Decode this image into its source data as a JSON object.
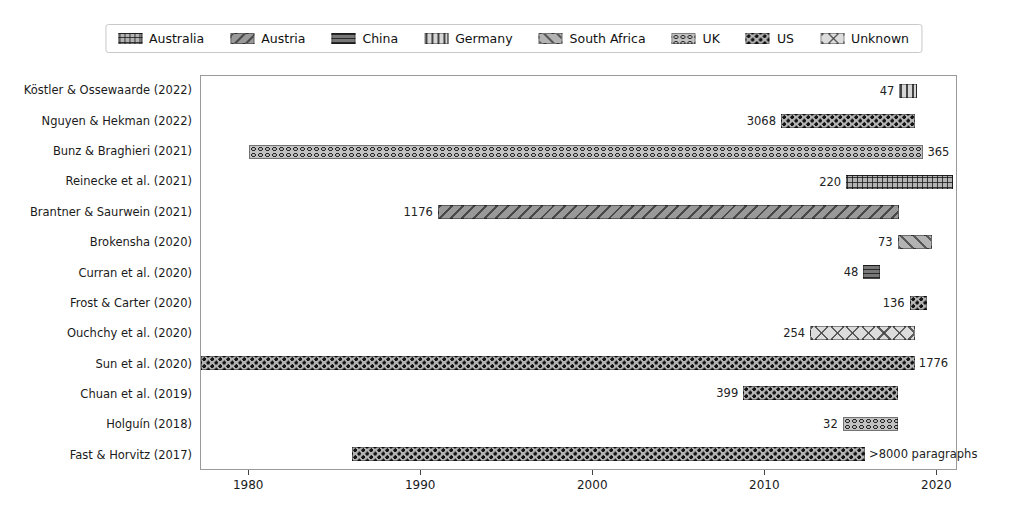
{
  "accent_colors": {
    "text": "#1a1a1a",
    "axis": "#9a9a9a",
    "background": "#ffffff"
  },
  "legend": {
    "entries": [
      {
        "label": "Australia",
        "hatch": "plus",
        "face": "#b3b3b3"
      },
      {
        "label": "Austria",
        "hatch": "backslash",
        "face": "#999999"
      },
      {
        "label": "China",
        "hatch": "hlines",
        "face": "#787878"
      },
      {
        "label": "Germany",
        "hatch": "vlines",
        "face": "#d6d6d6"
      },
      {
        "label": "South Africa",
        "hatch": "slash",
        "face": "#b3b3b3"
      },
      {
        "label": "UK",
        "hatch": "circles",
        "face": "#c2c2c2"
      },
      {
        "label": "US",
        "hatch": "stars",
        "face": "#b3b3b3"
      },
      {
        "label": "Unknown",
        "hatch": "bigx",
        "face": "#dcdcdc"
      }
    ]
  },
  "chart_data": {
    "type": "bar",
    "orientation": "horizontal",
    "title": "",
    "xlabel": "",
    "ylabel": "",
    "xlim": [
      1977.2,
      2021.2
    ],
    "x_ticks": [
      1980,
      1990,
      2000,
      2010,
      2020
    ],
    "grid": false,
    "legend_position": "top-center",
    "rows": [
      {
        "study": "Köstler & Ossewaarde (2022)",
        "country": "Germany",
        "start": 2017.9,
        "end": 2018.9,
        "count": "47",
        "count_side": "left"
      },
      {
        "study": "Nguyen & Hekman (2022)",
        "country": "US",
        "start": 2011.0,
        "end": 2018.8,
        "count": "3068",
        "count_side": "left"
      },
      {
        "study": "Bunz & Braghieri (2021)",
        "country": "UK",
        "start": 1980.0,
        "end": 2019.3,
        "count": "365",
        "count_side": "right"
      },
      {
        "study": "Reinecke et al. (2021)",
        "country": "Australia",
        "start": 2014.8,
        "end": 2021.0,
        "count": "220",
        "count_side": "left"
      },
      {
        "study": "Brantner & Saurwein (2021)",
        "country": "Austria",
        "start": 1991.0,
        "end": 2017.9,
        "count": "1176",
        "count_side": "left"
      },
      {
        "study": "Brokensha (2020)",
        "country": "South Africa",
        "start": 2017.8,
        "end": 2019.8,
        "count": "73",
        "count_side": "left"
      },
      {
        "study": "Curran et al. (2020)",
        "country": "China",
        "start": 2015.8,
        "end": 2016.8,
        "count": "48",
        "count_side": "left"
      },
      {
        "study": "Frost & Carter (2020)",
        "country": "US",
        "start": 2018.5,
        "end": 2019.5,
        "count": "136",
        "count_side": "left"
      },
      {
        "study": "Ouchchy et al. (2020)",
        "country": "Unknown",
        "start": 2012.7,
        "end": 2018.8,
        "count": "254",
        "count_side": "left"
      },
      {
        "study": "Sun et al. (2020)",
        "country": "US",
        "start": 1977.2,
        "end": 2018.8,
        "count": "1776",
        "count_side": "right"
      },
      {
        "study": "Chuan et al. (2019)",
        "country": "US",
        "start": 2008.8,
        "end": 2017.8,
        "count": "399",
        "count_side": "left"
      },
      {
        "study": "Holguín (2018)",
        "country": "UK",
        "start": 2014.6,
        "end": 2017.8,
        "count": "32",
        "count_side": "left"
      },
      {
        "study": "Fast & Horvitz (2017)",
        "country": "US",
        "start": 1986.0,
        "end": 2015.9,
        "count": ">8000 paragraphs",
        "count_side": "right"
      }
    ]
  }
}
